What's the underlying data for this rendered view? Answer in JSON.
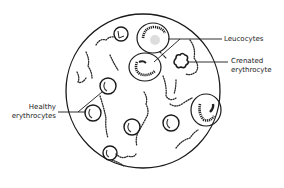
{
  "diagram": {
    "colors": {
      "ink": "#1a1a1a",
      "background": "#ffffff"
    },
    "field": {
      "cx": 143,
      "cy": 91,
      "r": 77
    },
    "labels": {
      "leucocytes": "Leucocytes",
      "crenated_line1": "Crenated",
      "crenated_line2": "erythrocyte",
      "healthy_line1": "Healthy",
      "healthy_line2": "erythrocytes"
    },
    "cells": {
      "leucocytes": [
        {
          "cx": 153,
          "cy": 38,
          "rx": 16,
          "ry": 15
        },
        {
          "cx": 145,
          "cy": 67,
          "rx": 16,
          "ry": 14
        },
        {
          "cx": 206,
          "cy": 110,
          "rx": 15,
          "ry": 16
        }
      ],
      "healthy_erythrocytes": [
        {
          "cx": 121,
          "cy": 34,
          "r": 7
        },
        {
          "cx": 108,
          "cy": 86,
          "r": 8
        },
        {
          "cx": 93,
          "cy": 113,
          "r": 8
        },
        {
          "cx": 132,
          "cy": 127,
          "r": 8
        },
        {
          "cx": 171,
          "cy": 123,
          "r": 8
        },
        {
          "cx": 110,
          "cy": 153,
          "r": 7
        }
      ],
      "crenated_erythrocyte": {
        "cx": 181,
        "cy": 61,
        "r": 6
      }
    }
  }
}
